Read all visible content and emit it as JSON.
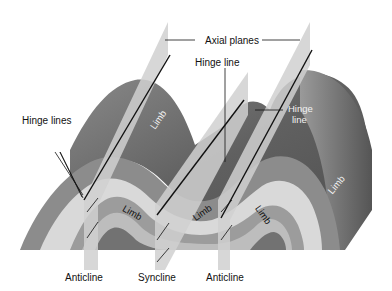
{
  "diagram": {
    "labels": {
      "axial_planes": "Axial planes",
      "hinge_line_top": "Hinge line",
      "hinge_line_right": "Hinge\nline",
      "hinge_line_right_1": "Hinge",
      "hinge_line_right_2": "line",
      "hinge_lines_left": "Hinge lines",
      "limb_upper_left": "Limb",
      "limb_right_face": "Limb",
      "limb_front_1": "Limb",
      "limb_front_2": "Limb",
      "limb_front_3": "Limb",
      "anticline_left": "Anticline",
      "syncline": "Syncline",
      "anticline_right": "Anticline"
    },
    "colors": {
      "background": "#ffffff",
      "surface_dark": "#5e5e5e",
      "surface_mid": "#7a7a7a",
      "layer_light": "#d6d6d6",
      "layer_mid": "#9a9a9a",
      "layer_core": "#6f6f6f",
      "axial_plane": "#cfcfcf",
      "hinge_line": "#111111"
    }
  }
}
